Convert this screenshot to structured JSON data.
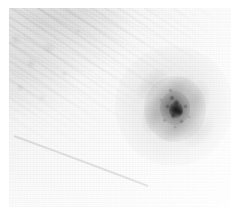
{
  "view": {
    "title": "Astronomical survey cutout",
    "subject": "spiral galaxy",
    "rendering": "inverted grayscale (negative)",
    "caption": "",
    "canvas": {
      "width_px": 239,
      "height_px": 224,
      "background": "#ffffff"
    },
    "frame": {
      "left_px": 9,
      "top_px": 8,
      "width_px": 222,
      "height_px": 199,
      "background": "#fbfbfb",
      "margin_color": "#ffffff"
    }
  },
  "palette": {
    "page_white": "#ffffff",
    "sky_light": "#fefefe",
    "sky_mid": "#f3f3f4",
    "sky_dark": "#eeeeef",
    "nucleus_dark": "#3a3a3a",
    "core_dark": "#555555",
    "halo_gray": "#c8c8c8",
    "trail_gray": "#e2e2e4"
  },
  "features": [
    {
      "name": "galaxy-nucleus",
      "label": "Bright nucleus",
      "center_px": [
        176,
        110
      ],
      "size_px": [
        14,
        16
      ],
      "intensity": "darkest (brightest in positive)"
    },
    {
      "name": "galaxy-bulge",
      "label": "Central bulge",
      "center_px": [
        175,
        108
      ],
      "size_px": [
        30,
        34
      ],
      "intensity": "strong"
    },
    {
      "name": "galaxy-disk",
      "label": "Inner disk / spiral arms",
      "center_px": [
        175,
        107
      ],
      "size_px": [
        62,
        66
      ],
      "intensity": "moderate"
    },
    {
      "name": "galaxy-halo",
      "label": "Outer halo",
      "center_px": [
        174,
        106
      ],
      "size_px": [
        118,
        120
      ],
      "intensity": "faint"
    },
    {
      "name": "cirrus-field",
      "label": "Wispy cirrus streaks",
      "region_px": [
        9,
        8,
        110,
        95
      ],
      "orientation_deg": 32,
      "intensity": "very faint"
    },
    {
      "name": "satellite-trail",
      "label": "Thin linear trail",
      "start_px": [
        14,
        136
      ],
      "end_px": [
        148,
        186
      ],
      "intensity": "very faint"
    }
  ],
  "arms": [
    {
      "name": "arm-north",
      "cx": 174,
      "cy": 92,
      "rx": 24,
      "ry": 13,
      "rot": -34,
      "alpha": 0.13
    },
    {
      "name": "arm-south",
      "cx": 178,
      "cy": 126,
      "rx": 25,
      "ry": 13,
      "rot": -28,
      "alpha": 0.12
    },
    {
      "name": "arm-west",
      "cx": 156,
      "cy": 114,
      "rx": 14,
      "ry": 22,
      "rot": 22,
      "alpha": 0.11
    },
    {
      "name": "arm-east",
      "cx": 196,
      "cy": 100,
      "rx": 14,
      "ry": 21,
      "rot": 18,
      "alpha": 0.1
    },
    {
      "name": "arm-outer-nw",
      "cx": 152,
      "cy": 84,
      "rx": 20,
      "ry": 11,
      "rot": -46,
      "alpha": 0.07
    },
    {
      "name": "arm-outer-se",
      "cx": 200,
      "cy": 132,
      "rx": 20,
      "ry": 11,
      "rot": -42,
      "alpha": 0.06
    }
  ],
  "knots": [
    {
      "name": "knot-a",
      "cx": 172,
      "cy": 98,
      "r": 3.0,
      "alpha": 0.4
    },
    {
      "name": "knot-b",
      "cx": 177,
      "cy": 103,
      "r": 3.6,
      "alpha": 0.46
    },
    {
      "name": "knot-c",
      "cx": 180,
      "cy": 112,
      "r": 4.2,
      "alpha": 0.52
    },
    {
      "name": "knot-d",
      "cx": 173,
      "cy": 116,
      "r": 3.2,
      "alpha": 0.38
    },
    {
      "name": "knot-e",
      "cx": 168,
      "cy": 107,
      "r": 2.6,
      "alpha": 0.3
    },
    {
      "name": "knot-f",
      "cx": 185,
      "cy": 106,
      "r": 2.4,
      "alpha": 0.26
    },
    {
      "name": "knot-g",
      "cx": 170,
      "cy": 90,
      "r": 2.2,
      "alpha": 0.22
    },
    {
      "name": "knot-h",
      "cx": 182,
      "cy": 122,
      "r": 2.6,
      "alpha": 0.24
    },
    {
      "name": "knot-i",
      "cx": 164,
      "cy": 120,
      "r": 2.2,
      "alpha": 0.18
    },
    {
      "name": "knot-j",
      "cx": 189,
      "cy": 117,
      "r": 2.0,
      "alpha": 0.16
    },
    {
      "name": "knot-k",
      "cx": 175,
      "cy": 127,
      "r": 2.0,
      "alpha": 0.15
    },
    {
      "name": "knot-l",
      "cx": 161,
      "cy": 100,
      "r": 2.0,
      "alpha": 0.14
    }
  ],
  "chart_data": {
    "type": "heatmap",
    "title": "",
    "xlabel": "",
    "ylabel": "",
    "colormap": "gray_reversed",
    "value_range": [
      0.0,
      1.0
    ],
    "note": "Inverted-grayscale astronomical cutout: dark = bright sky signal."
  }
}
